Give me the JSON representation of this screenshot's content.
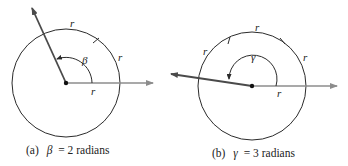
{
  "figures": [
    {
      "id": "a",
      "caption_prefix": "(a)",
      "angle_symbol": "β",
      "caption_equals": "= 2 radians",
      "radius_label": "r",
      "arc_labels": [
        "r",
        "r"
      ],
      "angle_radians": 2
    },
    {
      "id": "b",
      "caption_prefix": "(b)",
      "angle_symbol": "γ",
      "caption_equals": "= 3 radians",
      "radius_label": "r",
      "arc_labels": [
        "r",
        "r",
        "r"
      ],
      "angle_radians": 3
    }
  ],
  "colors": {
    "circle": "#2b2b2b",
    "ray_initial": "#8c8c8c",
    "ray_terminal": "#4a4a4a",
    "text": "#222222"
  }
}
